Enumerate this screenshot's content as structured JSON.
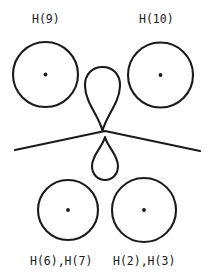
{
  "figure": {
    "background_color": "#ffffff",
    "stroke_color": "#1a1a1a",
    "text_color": "#1a1a1a",
    "width": 212,
    "height": 278
  },
  "labels": {
    "top_left": "H(9)",
    "top_right": "H(10)",
    "bottom_left": "H(6),H(7)",
    "bottom_right": "H(2),H(3)"
  },
  "shapes": {
    "circle_top_left": {
      "cx": 45.5,
      "cy": 74.5,
      "r": 32.5,
      "has_center_dot": true
    },
    "circle_top_right": {
      "cx": 160.5,
      "cy": 75.0,
      "r": 32.5,
      "has_center_dot": true
    },
    "circle_bottom_left": {
      "cx": 68.0,
      "cy": 210.0,
      "r": 30.0,
      "has_center_dot": true
    },
    "circle_bottom_right": {
      "cx": 144.0,
      "cy": 210.0,
      "r": 32.0,
      "has_center_dot": true
    },
    "lobe_upper": {
      "orientation": "point-down",
      "cx": 102.5,
      "top": 67,
      "bottom": 131,
      "half_width": 18
    },
    "lobe_lower": {
      "orientation": "point-up",
      "cx": 105.0,
      "top": 137,
      "bottom": 180,
      "half_width": 13
    },
    "ridge_line": {
      "left_x": 15,
      "left_y": 150,
      "peak_x": 105,
      "peak_y": 131,
      "right_x": 200,
      "right_y": 151
    }
  }
}
